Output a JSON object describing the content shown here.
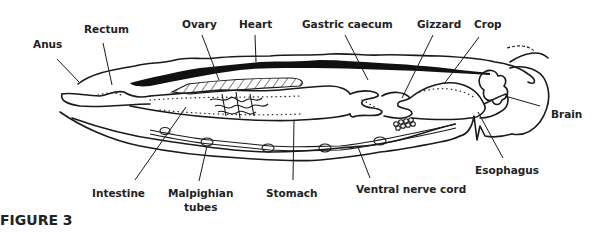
{
  "figure": {
    "caption": "FIGURE 3"
  },
  "labels": {
    "anus": "Anus",
    "rectum": "Rectum",
    "ovary": "Ovary",
    "heart": "Heart",
    "gastric_caecum": "Gastric caecum",
    "gizzard": "Gizzard",
    "crop": "Crop",
    "brain": "Brain",
    "esophagus": "Esophagus",
    "intestine": "Intestine",
    "malpighian_line1": "Malpighian",
    "malpighian_line2": "tubes",
    "stomach": "Stomach",
    "ventral_nerve_cord": "Ventral nerve cord"
  },
  "colors": {
    "ink": "#1a1a1a",
    "background": "#ffffff"
  }
}
